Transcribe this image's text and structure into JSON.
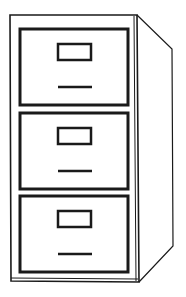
{
  "illustration": {
    "subject": "filing-cabinet",
    "drawer_count": 3,
    "drawers": [
      {
        "label_slot": true,
        "handle": true
      },
      {
        "label_slot": true,
        "handle": true
      },
      {
        "label_slot": true,
        "handle": true
      }
    ],
    "colors": {
      "stroke": "#1a1a1a",
      "background": "#ffffff"
    }
  }
}
